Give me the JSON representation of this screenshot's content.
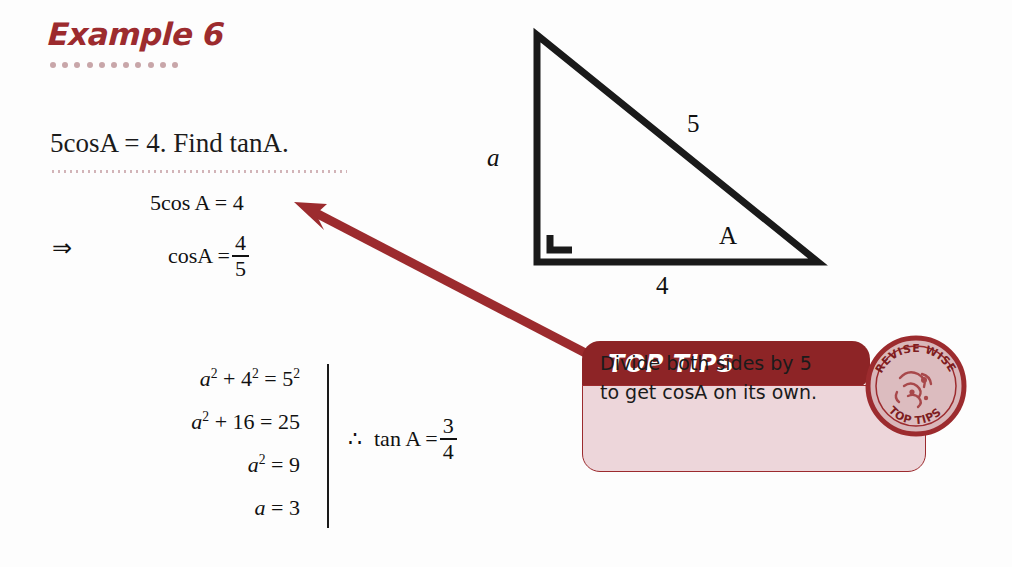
{
  "title": "Example 6",
  "question": "5cosA  =  4. Find tanA.",
  "work": {
    "line1": "5cos A = 4",
    "implies_symbol": "⇒",
    "line2_lhs": "cosA =",
    "line2_num": "4",
    "line2_den": "5"
  },
  "pythagoras": {
    "rows": [
      {
        "var": "a",
        "sup": "2",
        "rest": " + 4",
        "sup2": "2",
        "rest2": " = 5",
        "sup3": "2"
      },
      {
        "var": "a",
        "sup": "2",
        "rest": " + 16 = 25",
        "sup2": "",
        "rest2": "",
        "sup3": ""
      },
      {
        "var": "a",
        "sup": "2",
        "rest": " = 9",
        "sup2": "",
        "rest2": "",
        "sup3": ""
      },
      {
        "var": "a",
        "sup": "",
        "rest": " = 3",
        "sup2": "",
        "rest2": "",
        "sup3": ""
      }
    ],
    "row1": "a² + 4² = 5²",
    "row2": "a² + 16 = 25",
    "row3": "a² = 9",
    "row4": "a = 3"
  },
  "conclusion": {
    "therefore_symbol": "∴",
    "expression": "tan A =",
    "num": "3",
    "den": "4"
  },
  "triangle": {
    "side_vertical_label": "a",
    "side_hypotenuse_label": "5",
    "side_base_label": "4",
    "angle_label": "A",
    "stroke_color": "#1a1a1a"
  },
  "tip": {
    "header": "TOP TIPS",
    "line1": "Divide both sides by 5",
    "line2": "to get cosA on its own.",
    "header_color": "#8D2426",
    "body_color": "#EDD6DA",
    "border_color": "#9C2B2E"
  },
  "seal": {
    "top_text_1": "EDCO",
    "top_text_2": "REVISE WISE",
    "bottom_text": "TOP TIPS",
    "color": "#9C2B2E"
  },
  "arrow": {
    "color": "#9C2B2E"
  },
  "colors": {
    "accent_red": "#9C2B2E",
    "dark_maroon": "#8D2426",
    "dot_pink": "#C8A6A9",
    "ink": "#111111"
  }
}
